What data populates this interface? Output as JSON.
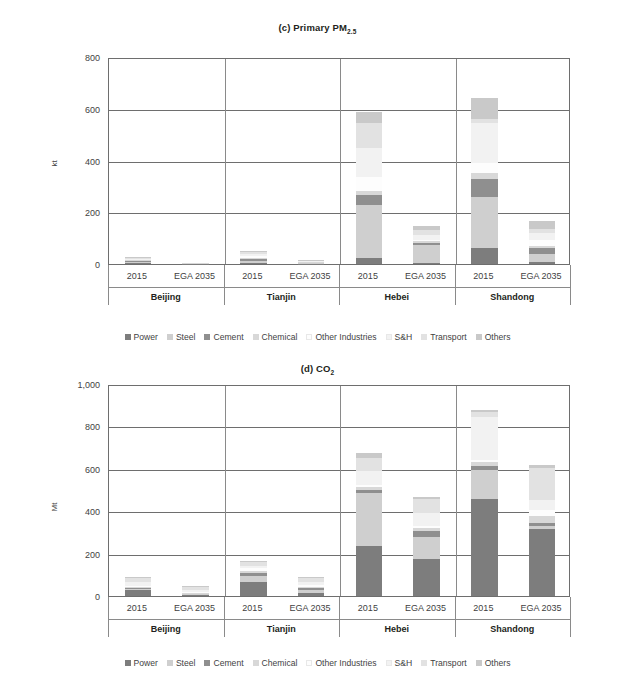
{
  "figure": {
    "background": "#ffffff",
    "axis_color": "#6e6e6e"
  },
  "legend": {
    "items": [
      {
        "label": "Power",
        "color": "#7d7d7d"
      },
      {
        "label": "Steel",
        "color": "#cfcfcf"
      },
      {
        "label": "Cement",
        "color": "#8f8f8f"
      },
      {
        "label": "Chemical",
        "color": "#d8d8d8"
      },
      {
        "label": "Other Industries",
        "color": "#fdfdfd"
      },
      {
        "label": "S&H",
        "color": "#f2f2f2"
      },
      {
        "label": "Transport",
        "color": "#e2e2e2"
      },
      {
        "label": "Others",
        "color": "#c9c9c9"
      }
    ]
  },
  "chart_data": [
    {
      "id": "c",
      "type": "bar",
      "stacked": true,
      "title": "(c) Primary PM",
      "title_sub": "2.5",
      "title_full": "(c) Primary PM2.5",
      "xlabel": "",
      "ylabel": "kt",
      "ylim": [
        0,
        800
      ],
      "yticks": [
        0,
        200,
        400,
        600,
        800
      ],
      "ytick_labels": [
        "0",
        "200",
        "400",
        "600",
        "800"
      ],
      "grid": true,
      "groups": [
        "Beijing",
        "Tianjin",
        "Hebei",
        "Shandong"
      ],
      "categories": [
        "2015",
        "EGA 2035",
        "2015",
        "EGA 2035",
        "2015",
        "EGA 2035",
        "2015",
        "EGA 2035"
      ],
      "series": [
        {
          "name": "Power",
          "color": "#7d7d7d",
          "values": [
            3,
            0.5,
            5,
            1,
            22,
            3,
            60,
            9
          ]
        },
        {
          "name": "Steel",
          "color": "#cfcfcf",
          "values": [
            4,
            0.5,
            6,
            1,
            205,
            70,
            200,
            30
          ]
        },
        {
          "name": "Cement",
          "color": "#8f8f8f",
          "values": [
            5,
            0.5,
            8,
            2,
            40,
            10,
            70,
            22
          ]
        },
        {
          "name": "Chemical",
          "color": "#d8d8d8",
          "values": [
            2,
            0.3,
            3,
            1,
            15,
            5,
            20,
            8
          ]
        },
        {
          "name": "Other Industries",
          "color": "#fdfdfd",
          "values": [
            3,
            0.5,
            8,
            3,
            55,
            5,
            40,
            25
          ]
        },
        {
          "name": "S&H",
          "color": "#f2f2f2",
          "values": [
            4,
            0.5,
            10,
            3,
            110,
            18,
            155,
            25
          ]
        },
        {
          "name": "Transport",
          "color": "#e2e2e2",
          "values": [
            4,
            1,
            6,
            2,
            100,
            20,
            15,
            15
          ]
        },
        {
          "name": "Others",
          "color": "#c9c9c9",
          "values": [
            3,
            0.5,
            5,
            2,
            40,
            15,
            80,
            32
          ]
        }
      ],
      "totals": [
        28,
        4,
        51,
        15,
        587,
        146,
        640,
        166
      ]
    },
    {
      "id": "d",
      "type": "bar",
      "stacked": true,
      "title": "(d) CO",
      "title_sub": "2",
      "title_full": "(d) CO2",
      "xlabel": "",
      "ylabel": "Mt",
      "ylim": [
        0,
        1000
      ],
      "yticks": [
        0,
        200,
        400,
        600,
        800,
        1000
      ],
      "ytick_labels": [
        "0",
        "200",
        "400",
        "600",
        "800",
        "1,000"
      ],
      "grid": true,
      "groups": [
        "Beijing",
        "Tianjin",
        "Hebei",
        "Shandong"
      ],
      "categories": [
        "2015",
        "EGA 2035",
        "2015",
        "EGA 2035",
        "2015",
        "EGA 2035",
        "2015",
        "EGA 2035"
      ],
      "series": [
        {
          "name": "Power",
          "color": "#7d7d7d",
          "values": [
            30,
            3,
            66,
            16,
            235,
            176,
            456,
            317
          ]
        },
        {
          "name": "Steel",
          "color": "#cfcfcf",
          "values": [
            5,
            5,
            30,
            14,
            250,
            102,
            140,
            12
          ]
        },
        {
          "name": "Cement",
          "color": "#8f8f8f",
          "values": [
            3,
            2,
            12,
            6,
            17,
            30,
            16,
            17
          ]
        },
        {
          "name": "Chemical",
          "color": "#d8d8d8",
          "values": [
            4,
            4,
            10,
            8,
            10,
            12,
            18,
            30
          ]
        },
        {
          "name": "Other Industries",
          "color": "#fdfdfd",
          "values": [
            4,
            4,
            12,
            8,
            10,
            12,
            14,
            30
          ]
        },
        {
          "name": "S&H",
          "color": "#f2f2f2",
          "values": [
            20,
            10,
            12,
            14,
            70,
            60,
            200,
            48
          ]
        },
        {
          "name": "Transport",
          "color": "#e2e2e2",
          "values": [
            20,
            16,
            18,
            18,
            60,
            64,
            22,
            148
          ]
        },
        {
          "name": "Others",
          "color": "#c9c9c9",
          "values": [
            4,
            3,
            5,
            8,
            22,
            12,
            14,
            18
          ]
        }
      ],
      "totals": [
        90,
        47,
        165,
        92,
        674,
        468,
        880,
        620
      ]
    }
  ]
}
